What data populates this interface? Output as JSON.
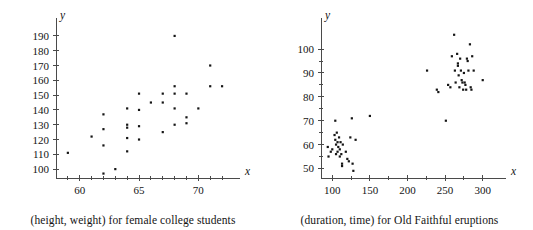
{
  "figure": {
    "title": "",
    "background": "#ffffff",
    "point_color": "#151515",
    "axis_color": "#4a4a4a"
  },
  "chart_data": [
    {
      "id": "height-weight",
      "type": "scatter",
      "title": "",
      "caption": "(height, weight) for female college students",
      "xlabel": "x",
      "ylabel": "y",
      "xlim": [
        58,
        72.5
      ],
      "ylim": [
        94,
        194
      ],
      "grid": false,
      "legend": null,
      "x_ticks_major": [
        60,
        65,
        70
      ],
      "x_tick_labels": [
        "60",
        "65",
        "70"
      ],
      "x_ticks_minor": [
        59,
        61,
        62,
        63,
        64,
        66,
        67,
        68,
        69,
        71,
        72
      ],
      "y_ticks_major": [
        100,
        110,
        120,
        130,
        140,
        150,
        160,
        170,
        180,
        190
      ],
      "y_tick_labels": [
        "100",
        "110",
        "120",
        "130",
        "140",
        "150",
        "160",
        "170",
        "180",
        "190"
      ],
      "points": [
        [
          59,
          111
        ],
        [
          61,
          122
        ],
        [
          62,
          137
        ],
        [
          62,
          127
        ],
        [
          62,
          116
        ],
        [
          62,
          97
        ],
        [
          63,
          100
        ],
        [
          64,
          141
        ],
        [
          64,
          130
        ],
        [
          64,
          128
        ],
        [
          64,
          121
        ],
        [
          64,
          112
        ],
        [
          65,
          151
        ],
        [
          65,
          140
        ],
        [
          65,
          129
        ],
        [
          65,
          120
        ],
        [
          66,
          145
        ],
        [
          67,
          151
        ],
        [
          67,
          145
        ],
        [
          67,
          125
        ],
        [
          68,
          190
        ],
        [
          68,
          156
        ],
        [
          68,
          151
        ],
        [
          68,
          141
        ],
        [
          68,
          130
        ],
        [
          69,
          151
        ],
        [
          69,
          135
        ],
        [
          69,
          131
        ],
        [
          70,
          141
        ],
        [
          71,
          170
        ],
        [
          71,
          156
        ],
        [
          72,
          156
        ]
      ]
    },
    {
      "id": "old-faithful",
      "type": "scatter",
      "title": "",
      "caption": "(duration, time) for Old Faithful eruptions",
      "xlabel": "x",
      "ylabel": "y",
      "xlim": [
        85,
        315
      ],
      "ylim": [
        46,
        108
      ],
      "grid": false,
      "legend": null,
      "x_ticks_major": [
        100,
        150,
        200,
        250,
        300
      ],
      "x_tick_labels": [
        "100",
        "150",
        "200",
        "250",
        "300"
      ],
      "x_ticks_minor": [
        125,
        175,
        225,
        275
      ],
      "y_ticks_major": [
        50,
        60,
        70,
        80,
        90,
        100
      ],
      "y_tick_labels": [
        "50",
        "60",
        "70",
        "80",
        "90",
        "100"
      ],
      "y_ticks_minor": [
        55,
        65,
        75,
        85,
        95
      ],
      "points": [
        [
          94,
          59
        ],
        [
          95,
          55
        ],
        [
          98,
          57
        ],
        [
          100,
          58
        ],
        [
          103,
          64
        ],
        [
          104,
          70
        ],
        [
          104,
          62
        ],
        [
          105,
          60
        ],
        [
          105,
          56
        ],
        [
          106,
          65
        ],
        [
          107,
          61
        ],
        [
          107,
          57
        ],
        [
          108,
          59
        ],
        [
          109,
          63
        ],
        [
          110,
          55
        ],
        [
          110,
          58
        ],
        [
          111,
          61
        ],
        [
          112,
          56
        ],
        [
          113,
          52
        ],
        [
          113,
          51
        ],
        [
          114,
          60
        ],
        [
          118,
          57
        ],
        [
          120,
          54
        ],
        [
          122,
          53
        ],
        [
          124,
          63
        ],
        [
          126,
          71
        ],
        [
          127,
          52
        ],
        [
          128,
          49
        ],
        [
          131,
          62
        ],
        [
          150,
          72
        ],
        [
          226,
          91
        ],
        [
          239,
          83
        ],
        [
          241,
          82
        ],
        [
          251,
          70
        ],
        [
          254,
          85
        ],
        [
          257,
          84
        ],
        [
          259,
          97
        ],
        [
          262,
          106
        ],
        [
          263,
          91
        ],
        [
          264,
          86
        ],
        [
          266,
          98
        ],
        [
          267,
          93
        ],
        [
          267,
          94
        ],
        [
          268,
          89
        ],
        [
          269,
          84
        ],
        [
          270,
          96
        ],
        [
          271,
          91
        ],
        [
          272,
          87
        ],
        [
          273,
          86
        ],
        [
          274,
          83
        ],
        [
          275,
          90
        ],
        [
          276,
          86
        ],
        [
          277,
          85
        ],
        [
          278,
          83
        ],
        [
          279,
          96
        ],
        [
          280,
          95
        ],
        [
          281,
          91
        ],
        [
          283,
          102
        ],
        [
          284,
          84
        ],
        [
          285,
          83
        ],
        [
          286,
          97
        ],
        [
          288,
          91
        ],
        [
          300,
          87
        ]
      ]
    }
  ]
}
